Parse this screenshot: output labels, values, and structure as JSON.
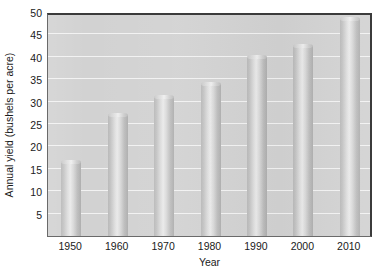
{
  "chart_data": {
    "type": "bar",
    "title": "",
    "xlabel": "Year",
    "ylabel": "Annual yield (bushels per acre)",
    "categories": [
      "1950",
      "1960",
      "1970",
      "1980",
      "1990",
      "2000",
      "2010"
    ],
    "values": [
      16.5,
      27,
      31,
      34,
      40,
      42.5,
      48.5
    ],
    "ylim": [
      0,
      50
    ],
    "yticks": [
      5,
      10,
      15,
      20,
      25,
      30,
      35,
      40,
      45,
      50
    ],
    "ytick_labels": [
      "5",
      "10",
      "15",
      "20",
      "25",
      "30",
      "35",
      "40",
      "45",
      "50"
    ],
    "grid": "horizontal",
    "legend": "none",
    "series": [
      {
        "name": "Annual yield",
        "values": [
          16.5,
          27,
          31,
          34,
          40,
          42.5,
          48.5
        ]
      }
    ],
    "colors": {
      "plot_background": "#d2d2d2",
      "gridline": "#f2f2f2",
      "bar_light": "#eaeaea",
      "bar_mid": "#c3c3c3",
      "bar_dark": "#aeaeae",
      "axis": "#3b3b3b",
      "text": "#1a1a1a",
      "page_background": "#ffffff"
    }
  }
}
